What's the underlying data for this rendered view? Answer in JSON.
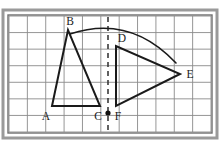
{
  "figure": {
    "kind": "geometry-diagram",
    "canvas": {
      "width": 220,
      "height": 145
    },
    "colors": {
      "background": "#ffffff",
      "outer_border": "#9a9a9a",
      "inner_border": "#6e6e6e",
      "grid_line": "#8a8a8a",
      "shape_stroke": "#1a1a1a",
      "label_text": "#1a1a1a",
      "dashed_axis": "#3a3a3a",
      "center_dot": "#111111"
    },
    "grid": {
      "columns": 11,
      "rows": 7,
      "cell_width": 16,
      "cell_height": 16,
      "origin_x": 20,
      "origin_y": 18,
      "show_grid": true
    },
    "frame": {
      "outer": {
        "x": 3,
        "y": 10,
        "width": 214,
        "height": 128
      },
      "inner": {
        "x": 8,
        "y": 15,
        "width": 204,
        "height": 118
      }
    },
    "shapes": [
      {
        "name": "triangle-abc",
        "type": "polygon",
        "label": "Triangle ABC",
        "points": "52,106 68,30 100,106",
        "stroke_width": 2.0
      },
      {
        "name": "triangle-fde",
        "type": "polygon",
        "label": "Triangle FDE",
        "points": "116,106 116,46 180,74",
        "stroke_width": 2.0
      }
    ],
    "axis": {
      "name": "axis-of-rotation",
      "type": "dashed-vertical-line",
      "x": 108,
      "y_start": 17,
      "y_end": 131,
      "dash_pattern": "5,4",
      "stroke_width": 1.6
    },
    "center_point": {
      "name": "center-of-rotation",
      "x": 108,
      "y": 113,
      "radius": 2.6
    },
    "arc": {
      "name": "rotation-arc",
      "type": "quadratic-curve",
      "start": {
        "x": 70,
        "y": 34
      },
      "control": {
        "x": 130,
        "y": 14
      },
      "end": {
        "x": 176,
        "y": 63
      },
      "stroke_width": 1.6
    },
    "labels": [
      {
        "id": "A",
        "text": "A",
        "x": 46,
        "y": 120,
        "anchor": "middle",
        "vertex": {
          "x": 52,
          "y": 106
        }
      },
      {
        "id": "B",
        "text": "B",
        "x": 70,
        "y": 25,
        "anchor": "middle",
        "vertex": {
          "x": 68,
          "y": 30
        }
      },
      {
        "id": "C",
        "text": "C",
        "x": 98,
        "y": 120,
        "anchor": "middle",
        "vertex": {
          "x": 100,
          "y": 106
        }
      },
      {
        "id": "D",
        "text": "D",
        "x": 122,
        "y": 42,
        "anchor": "middle",
        "vertex": {
          "x": 116,
          "y": 46
        }
      },
      {
        "id": "E",
        "text": "E",
        "x": 190,
        "y": 78,
        "anchor": "middle",
        "vertex": {
          "x": 180,
          "y": 74
        }
      },
      {
        "id": "F",
        "text": "F",
        "x": 118,
        "y": 120,
        "anchor": "middle",
        "vertex": {
          "x": 116,
          "y": 106
        }
      }
    ]
  }
}
